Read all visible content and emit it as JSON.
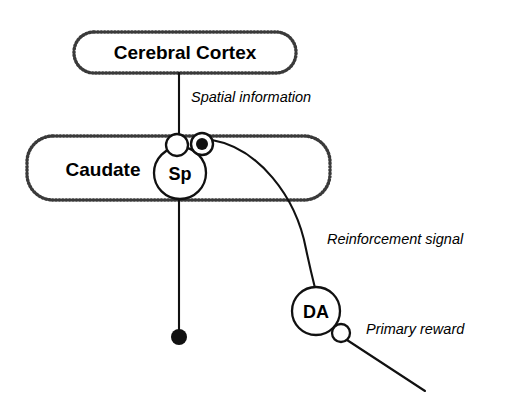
{
  "figure": {
    "background_color": "#ffffff",
    "line_color": "#111111",
    "box_border_color": "#3a3a3a"
  },
  "regions": [
    {
      "id": "cerebral-cortex",
      "label": "Cerebral Cortex",
      "shape": "rounded-rect-dotted",
      "x": 74,
      "y": 32,
      "width": 222,
      "height": 41,
      "label_x": 185,
      "label_y": 59
    },
    {
      "id": "caudate",
      "label": "Caudate",
      "shape": "rounded-rect-dotted",
      "x": 27,
      "y": 136,
      "width": 303,
      "height": 64,
      "label_x": 103,
      "label_y": 176
    }
  ],
  "nodes": [
    {
      "id": "sp-neuron",
      "label": "Sp",
      "shape": "circle",
      "cx": 180,
      "cy": 173,
      "r": 26,
      "label_x": 180,
      "label_y": 180
    },
    {
      "id": "da-neuron",
      "label": "DA",
      "shape": "circle",
      "cx": 316,
      "cy": 311,
      "r": 24,
      "label_x": 316,
      "label_y": 318
    }
  ],
  "synapses": [
    {
      "id": "cortex-to-sp-synapse",
      "type": "open",
      "cx": 177,
      "cy": 145,
      "r": 11
    },
    {
      "id": "da-to-sp-synapse",
      "type": "filled-ring",
      "cx": 202,
      "cy": 144,
      "r": 11,
      "core_r": 6
    },
    {
      "id": "primary-reward-synapse",
      "type": "open",
      "cx": 341,
      "cy": 333,
      "r": 9
    }
  ],
  "terminals": [
    {
      "id": "sp-axon-terminal",
      "type": "filled-dot",
      "cx": 179,
      "cy": 337,
      "r": 8
    }
  ],
  "connections": [
    {
      "id": "cortex-to-sp",
      "path": "M 179 73 L 179 135",
      "label": "Spatial information",
      "label_x": 191,
      "label_y": 102
    },
    {
      "id": "da-to-sp",
      "path": "M 212 140 C 258 148, 296 196, 306 249 C 310 268, 313 280, 315 288",
      "label": "Reinforcement signal",
      "label_x": 327,
      "label_y": 244
    },
    {
      "id": "sp-axon",
      "path": "M 179 199 L 179 330",
      "label": "",
      "label_x": 0,
      "label_y": 0
    },
    {
      "id": "primary-reward-input",
      "path": "M 347 340 L 425 391",
      "label": "Primary reward",
      "label_x": 366,
      "label_y": 334
    }
  ]
}
